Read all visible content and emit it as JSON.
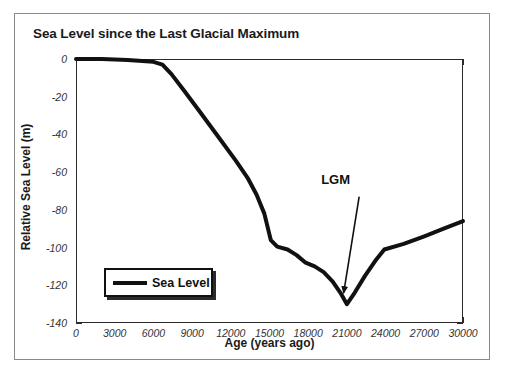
{
  "chart_data": {
    "type": "line",
    "title": "Sea Level since the Last Glacial Maximum",
    "xlabel": "Age (years ago)",
    "ylabel": "Relative Sea Level (m)",
    "xlim": [
      0,
      30000
    ],
    "ylim": [
      -140,
      0
    ],
    "grid": true,
    "legend_position": "bottom-left",
    "x_ticks": [
      0,
      3000,
      6000,
      9000,
      12000,
      15000,
      18000,
      21000,
      24000,
      27000,
      30000
    ],
    "x_tick_labels": [
      "0",
      "3000",
      "6000",
      "9000",
      "12000",
      "15000",
      "18000",
      "21000",
      "24000",
      "27000",
      "30000"
    ],
    "x_minor_interval": 1000,
    "y_ticks": [
      0,
      -20,
      -40,
      -60,
      -80,
      -100,
      -120,
      -140
    ],
    "y_tick_labels": [
      "0",
      "-20",
      "-40",
      "-60",
      "-80",
      "-100",
      "-120",
      "-140"
    ],
    "y_minor_interval": 5,
    "series": [
      {
        "name": "Sea Level",
        "color": "#111111",
        "line_width": 4,
        "x": [
          0,
          2000,
          4000,
          6000,
          6700,
          7400,
          8400,
          9600,
          11000,
          12400,
          13300,
          14000,
          14600,
          15100,
          15600,
          16400,
          17100,
          17800,
          18500,
          19200,
          19900,
          20500,
          21000,
          21600,
          22400,
          23200,
          23900,
          25400,
          27000,
          28500,
          30000
        ],
        "y": [
          0,
          0,
          -0.5,
          -1.5,
          -3,
          -8,
          -17,
          -28,
          -41,
          -54,
          -63,
          -72,
          -82,
          -96,
          -99.5,
          -101,
          -104,
          -108,
          -110,
          -113,
          -118,
          -124,
          -130,
          -124,
          -115,
          -107,
          -101,
          -98,
          -94,
          -90,
          -86
        ]
      }
    ],
    "annotations": [
      {
        "text": "LGM",
        "x": 21000,
        "y": -130,
        "label_x": 20400,
        "label_y": -64,
        "arrow_from": [
          21950,
          -73
        ],
        "arrow_to": [
          20750,
          -124
        ]
      }
    ]
  },
  "legend": {
    "entries": [
      {
        "label": "Sea Level",
        "color": "#111111"
      }
    ]
  }
}
